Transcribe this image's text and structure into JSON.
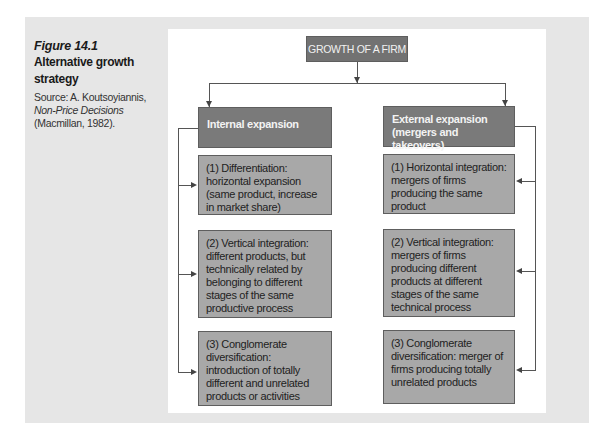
{
  "caption": {
    "figure_number": "Figure 14.1",
    "title": "Alternative growth strategy",
    "source_prefix": "Source: A. Koutsoyiannis, ",
    "source_book": "Non-Price Decisions",
    "source_suffix": " (Macmillan, 1982)."
  },
  "diagram": {
    "root": "GROWTH OF A FIRM",
    "left": {
      "heading": "Internal expansion",
      "items": [
        "(1) Differentiation: horizontal expansion (same product, increase in market share)",
        "(2) Vertical integration: different products, but technically related by belonging to different stages of the same productive process",
        "(3) Conglomerate diversification: introduction of totally different and unrelated products or activities"
      ]
    },
    "right": {
      "heading": "External expansion (mergers and takeovers)",
      "items": [
        "(1) Horizontal integration: mergers of firms producing the same product",
        "(2) Vertical integration: mergers of firms producing different products at different stages of the same technical process",
        "(3) Conglomerate diversification: merger of firms producing totally unrelated products"
      ]
    }
  },
  "colors": {
    "panel": "#e6e6e6",
    "root_box": "#727272",
    "heading_box": "#7a7a7a",
    "item_box": "#a8a8a8"
  }
}
